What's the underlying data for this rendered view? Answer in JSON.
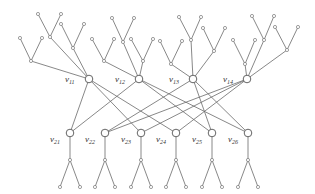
{
  "diagram": {
    "type": "bipartite-tree-graph",
    "top_layer": [
      {
        "id": "v11",
        "label": "v",
        "sub": "11",
        "x": 89,
        "y": 79
      },
      {
        "id": "v12",
        "label": "v",
        "sub": "12",
        "x": 139,
        "y": 79
      },
      {
        "id": "v13",
        "label": "v",
        "sub": "13",
        "x": 193,
        "y": 79
      },
      {
        "id": "v14",
        "label": "v",
        "sub": "14",
        "x": 247,
        "y": 79
      }
    ],
    "bottom_layer": [
      {
        "id": "v21",
        "label": "v",
        "sub": "21",
        "x": 70,
        "y": 133
      },
      {
        "id": "v22",
        "label": "v",
        "sub": "22",
        "x": 105,
        "y": 133
      },
      {
        "id": "v23",
        "label": "v",
        "sub": "23",
        "x": 141,
        "y": 133
      },
      {
        "id": "v24",
        "label": "v",
        "sub": "24",
        "x": 176,
        "y": 133
      },
      {
        "id": "v25",
        "label": "v",
        "sub": "25",
        "x": 212,
        "y": 133
      },
      {
        "id": "v26",
        "label": "v",
        "sub": "26",
        "x": 248,
        "y": 133
      }
    ],
    "cross_edges": [
      [
        "v11",
        "v21"
      ],
      [
        "v11",
        "v23"
      ],
      [
        "v11",
        "v24"
      ],
      [
        "v12",
        "v21"
      ],
      [
        "v12",
        "v25"
      ],
      [
        "v12",
        "v26"
      ],
      [
        "v13",
        "v22"
      ],
      [
        "v13",
        "v25"
      ],
      [
        "v13",
        "v26"
      ],
      [
        "v14",
        "v22"
      ],
      [
        "v14",
        "v23"
      ],
      [
        "v14",
        "v24"
      ]
    ],
    "colors": {
      "edge": "#6a6a6a",
      "node_stroke": "#777777",
      "label": "#333333",
      "background": "#ffffff"
    }
  }
}
